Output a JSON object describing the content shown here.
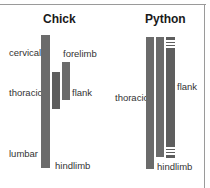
{
  "chick": {
    "title": "Chick",
    "labels": {
      "cervical": "cervical",
      "thoracic": "thoracic",
      "lumbar": "lumbar",
      "forelimb": "forelimb",
      "flank": "flank",
      "hindlimb": "hindlimb"
    }
  },
  "python": {
    "title": "Python",
    "labels": {
      "thoracic": "thoracic",
      "flank": "flank",
      "hindlimb": "hindlimb"
    }
  },
  "colors": {
    "bar": "#6b6b6b",
    "background": "#ffffff",
    "frame": "#9a9a9a"
  }
}
